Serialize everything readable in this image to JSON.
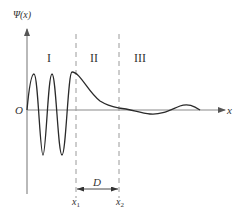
{
  "figure": {
    "y_axis_label": "Ψ(x)",
    "x_axis_label": "x",
    "origin_label": "O",
    "regions": [
      {
        "label": "I"
      },
      {
        "label": "II"
      },
      {
        "label": "III"
      }
    ],
    "boundaries": [
      {
        "label": "x",
        "subscript": "1"
      },
      {
        "label": "x",
        "subscript": "2"
      }
    ],
    "width_label": "D",
    "colors": {
      "curve": "#2a2a2a",
      "axes": "#8a8a8a",
      "dashed": "#9a9a9a",
      "text": "#333333"
    }
  }
}
